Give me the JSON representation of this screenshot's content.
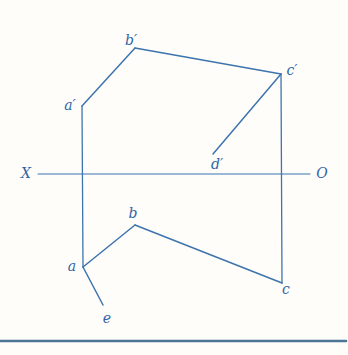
{
  "diagram": {
    "colors": {
      "line": "#3c74ad",
      "label": "#2f65a8",
      "baseline_rule": "#4d7696",
      "background": "#fffdfa"
    },
    "axis": {
      "left_label": "X",
      "right_label": "O",
      "y": 174,
      "x_start": 38,
      "x_end": 310
    },
    "points": {
      "a_prime": {
        "x": 82,
        "y": 106
      },
      "b_prime": {
        "x": 135,
        "y": 48
      },
      "c_prime": {
        "x": 281,
        "y": 74
      },
      "d_prime": {
        "x": 213,
        "y": 154
      },
      "a": {
        "x": 83,
        "y": 267
      },
      "b": {
        "x": 135,
        "y": 225
      },
      "c": {
        "x": 282,
        "y": 283
      },
      "e": {
        "x": 103,
        "y": 305
      }
    },
    "segments": [
      {
        "name": "axis-line",
        "x1": 38,
        "y1": 174,
        "x2": 310,
        "y2": 174,
        "width": 1.1
      },
      {
        "name": "a-prime-b-prime",
        "x1": 82,
        "y1": 106,
        "x2": 135,
        "y2": 48,
        "width": 1.5
      },
      {
        "name": "b-prime-c-prime",
        "x1": 135,
        "y1": 48,
        "x2": 281,
        "y2": 74,
        "width": 1.5
      },
      {
        "name": "c-prime-d-prime",
        "x1": 281,
        "y1": 74,
        "x2": 213,
        "y2": 154,
        "width": 1.5
      },
      {
        "name": "projector-a-prime-a",
        "x1": 82,
        "y1": 106,
        "x2": 83,
        "y2": 267,
        "width": 1.3
      },
      {
        "name": "projector-c-prime-c",
        "x1": 281,
        "y1": 74,
        "x2": 282,
        "y2": 283,
        "width": 1.3
      },
      {
        "name": "a-b",
        "x1": 83,
        "y1": 267,
        "x2": 135,
        "y2": 225,
        "width": 1.5
      },
      {
        "name": "b-c",
        "x1": 135,
        "y1": 225,
        "x2": 282,
        "y2": 283,
        "width": 1.5
      },
      {
        "name": "a-e",
        "x1": 83,
        "y1": 267,
        "x2": 103,
        "y2": 305,
        "width": 1.5
      },
      {
        "name": "bottom-rule",
        "x1": 0,
        "y1": 341,
        "x2": 346,
        "y2": 341,
        "width": 2.6,
        "color": "#4d7696"
      }
    ],
    "labels": [
      {
        "name": "x-axis-left",
        "text": "X",
        "x": 26,
        "y": 178
      },
      {
        "name": "x-axis-right",
        "text": "O",
        "x": 322,
        "y": 178
      },
      {
        "name": "a-prime",
        "text": "a′",
        "x": 70,
        "y": 110
      },
      {
        "name": "b-prime",
        "text": "b′",
        "x": 131,
        "y": 45
      },
      {
        "name": "c-prime",
        "text": "c′",
        "x": 292,
        "y": 75
      },
      {
        "name": "d-prime",
        "text": "d′",
        "x": 217,
        "y": 169
      },
      {
        "name": "a",
        "text": "a",
        "x": 72,
        "y": 271
      },
      {
        "name": "b",
        "text": "b",
        "x": 133,
        "y": 218
      },
      {
        "name": "c",
        "text": "c",
        "x": 286,
        "y": 294
      },
      {
        "name": "e",
        "text": "e",
        "x": 107,
        "y": 323
      }
    ]
  }
}
